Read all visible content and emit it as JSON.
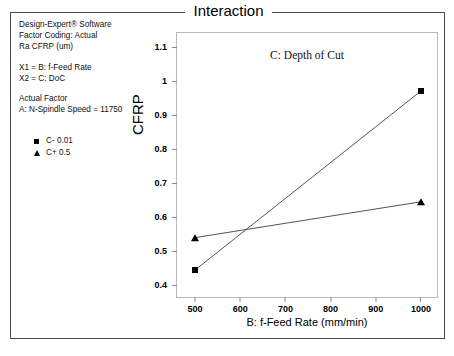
{
  "figure": {
    "title": "Interaction",
    "subtitle": "C: Depth of Cut"
  },
  "info": {
    "software": "Design-Expert® Software",
    "factor_coding": "Factor Coding: Actual",
    "response": "Ra CFRP (um)",
    "x1": "X1 = B: f-Feed Rate",
    "x2": "X2 = C: DoC",
    "actual_factor_heading": "Actual Factor",
    "actual_factor_value": "A: N-Spindle Speed = 11750"
  },
  "legend": {
    "items": [
      {
        "marker": "square-marker",
        "label": "C- 0.01"
      },
      {
        "marker": "triangle-marker",
        "label": "C+ 0.5"
      }
    ]
  },
  "chart_data": {
    "type": "line",
    "title": "Interaction",
    "subtitle": "C: Depth of Cut",
    "xlabel": "B: f-Feed Rate (mm/min)",
    "ylabel": "CFRP",
    "x": [
      500,
      1000
    ],
    "xlim": [
      460,
      1040
    ],
    "ylim": [
      0.36,
      1.14
    ],
    "xticks": [
      500,
      600,
      700,
      800,
      900,
      1000
    ],
    "yticks": [
      0.4,
      0.5,
      0.6,
      0.7,
      0.8,
      0.9,
      1,
      1.1
    ],
    "xtick_labels": [
      "500",
      "600",
      "700",
      "800",
      "900",
      "1000"
    ],
    "ytick_labels": [
      "0.4",
      "0.5",
      "0.6",
      "0.7",
      "0.8",
      "0.9",
      "1",
      "1.1"
    ],
    "grid": false,
    "legend_position": "outside-left",
    "series": [
      {
        "name": "C- 0.01",
        "marker": "square",
        "values": [
          0.445,
          0.97
        ]
      },
      {
        "name": "C+ 0.5",
        "marker": "triangle",
        "values": [
          0.54,
          0.645
        ]
      }
    ]
  }
}
